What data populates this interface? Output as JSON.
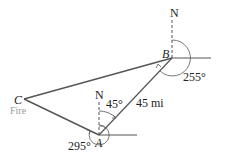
{
  "diagram": {
    "points": {
      "A": {
        "label": "A",
        "x": 99,
        "y": 135
      },
      "B": {
        "label": "B",
        "x": 172,
        "y": 58
      },
      "C": {
        "label": "C",
        "x": 24,
        "y": 99,
        "sublabel": "Fire"
      }
    },
    "north_labels": {
      "at_A": "N",
      "at_B": "N"
    },
    "angles": {
      "A_bearing_to_B": "45°",
      "A_bearing_to_C": "295°",
      "B_bearing_to_C": "255°"
    },
    "distances": {
      "AB": "45 mi"
    },
    "colors": {
      "line": "#555555",
      "text": "#222222",
      "fire_text": "#9a9a9a"
    }
  }
}
